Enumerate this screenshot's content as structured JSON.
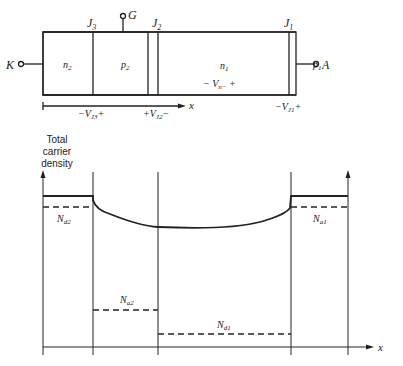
{
  "device": {
    "terminals": {
      "cathode": "K",
      "gate": "G",
      "anode": "A"
    },
    "junctions": [
      {
        "label": "J",
        "sub": "3"
      },
      {
        "label": "J",
        "sub": "2"
      },
      {
        "label": "J",
        "sub": "1"
      }
    ],
    "regions": [
      {
        "label": "n",
        "sub": "2"
      },
      {
        "label": "p",
        "sub": "2"
      },
      {
        "label": "n",
        "sub": "1"
      },
      {
        "label": "p",
        "sub": "1"
      }
    ],
    "vn_label": {
      "pre": "− V",
      "sub": "n−",
      "post": " +"
    },
    "x_axis_label": "x",
    "junction_voltages": [
      {
        "pre": "−V",
        "sub": "J3",
        "post": "+"
      },
      {
        "pre": "+V",
        "sub": "J2",
        "post": "−"
      },
      {
        "pre": "−V",
        "sub": "J1",
        "post": "+"
      }
    ]
  },
  "plot": {
    "ylabel_lines": [
      "Total",
      "carrier",
      "density"
    ],
    "xlabel": "x",
    "doping_labels": [
      {
        "label": "N",
        "sub": "d2"
      },
      {
        "label": "N",
        "sub": "a1"
      },
      {
        "label": "N",
        "sub": "a2"
      },
      {
        "label": "N",
        "sub": "d1"
      }
    ]
  }
}
